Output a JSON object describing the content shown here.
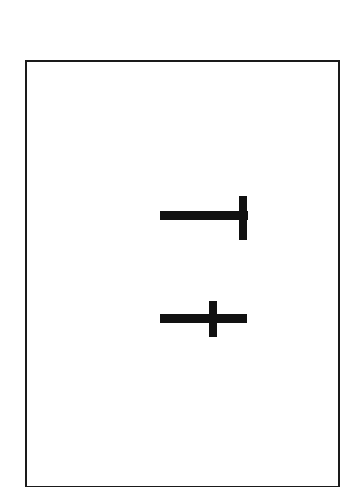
{
  "page": {
    "width": 351,
    "height": 487,
    "background_color": "#ffffff",
    "title": ""
  },
  "frame": {
    "name": "figure-border",
    "stroke_color": "#1a1a1a",
    "fill_color": "#ffffff",
    "stroke_width_px": 2,
    "x": 25,
    "y": 60,
    "width": 315,
    "height": 428,
    "label": ""
  },
  "figure": {
    "caption": "",
    "ink_color": "#111111",
    "shapes": [
      {
        "id": "tee",
        "name": "rotated-tee-shape",
        "glyph": "⊣",
        "description": "Horizontal bar meeting the top-to-bottom vertical bar at its right end, forming a T rotated 90 degrees counter-clockwise.",
        "label": "",
        "parts": [
          {
            "id": "tee-horizontal",
            "name": "tee-horizontal-bar",
            "orientation": "horizontal",
            "x": 160,
            "y": 211,
            "width": 88,
            "height": 9
          },
          {
            "id": "tee-vertical",
            "name": "tee-vertical-bar",
            "orientation": "vertical",
            "x": 239,
            "y": 196,
            "width": 8,
            "height": 44
          }
        ]
      },
      {
        "id": "plus",
        "name": "plus-cross-shape",
        "glyph": "+",
        "description": "Long horizontal bar crossed near its right third by a shorter vertical bar, forming a plus sign.",
        "label": "",
        "parts": [
          {
            "id": "plus-horizontal",
            "name": "plus-horizontal-bar",
            "orientation": "horizontal",
            "x": 160,
            "y": 314,
            "width": 87,
            "height": 9
          },
          {
            "id": "plus-vertical",
            "name": "plus-vertical-bar",
            "orientation": "vertical",
            "x": 209,
            "y": 301,
            "width": 8,
            "height": 36
          }
        ]
      }
    ]
  }
}
